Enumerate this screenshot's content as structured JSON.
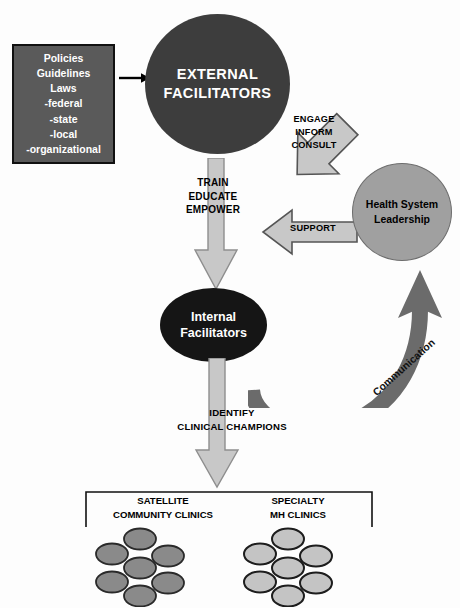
{
  "diagram": {
    "colors": {
      "external_circle": "#3d3d3d",
      "internal_circle": "#151515",
      "leadership_circle": "#a0a0a0",
      "policies_box": "#5a5a5a",
      "big_arrow": "#c8c8c8",
      "communication_arrow": "#6b6b6b",
      "satellite_dot": "#8a8a8a",
      "specialty_dot": "#c4c4c4"
    }
  },
  "policies_box": {
    "name": "policies-guidelines-laws",
    "lines": [
      "Policies",
      "Guidelines",
      "Laws",
      "-federal",
      "-state",
      "-local",
      "-organizational"
    ]
  },
  "nodes": {
    "external_facilitators": {
      "line1": "EXTERNAL",
      "line2": "FACILITATORS"
    },
    "internal_facilitators": {
      "line1": "Internal",
      "line2": "Facilitators"
    },
    "health_system_leadership": {
      "line1": "Health System",
      "line2": "Leadership"
    }
  },
  "arrows": {
    "policies_to_external": {
      "label": "",
      "direction": "right"
    },
    "train_educate_empower": {
      "lines": [
        "TRAIN",
        "EDUCATE",
        "EMPOWER"
      ],
      "direction": "down"
    },
    "engage_inform_consult": {
      "lines": [
        "ENGAGE",
        "INFORM",
        "CONSULT"
      ],
      "direction": "down-right"
    },
    "support": {
      "lines": [
        "SUPPORT"
      ],
      "direction": "left"
    },
    "identify_clinical_champions": {
      "lines": [
        "IDENTIFY",
        "CLINICAL CHAMPIONS"
      ],
      "direction": "down"
    },
    "communication": {
      "label": "Communication",
      "direction": "curved-up-right"
    }
  },
  "clinics": {
    "satellite": {
      "title_line1": "SATELLITE",
      "title_line2": "COMMUNITY CLINICS",
      "count": 7
    },
    "specialty": {
      "title_line1": "SPECIALTY",
      "title_line2": "MH CLINICS",
      "count": 7
    }
  }
}
